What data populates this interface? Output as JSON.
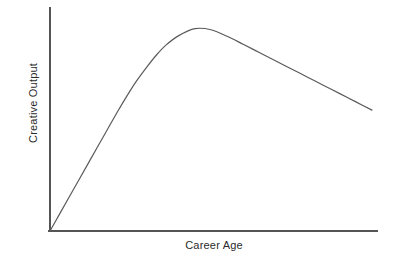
{
  "chart_data": {
    "type": "line",
    "title": "",
    "subtitle": "",
    "xlabel": "Career Age",
    "ylabel": "Creative Output",
    "grid": false,
    "legend": false,
    "legend_position": "none",
    "tick_labels_x": [],
    "tick_labels_y": [],
    "xlim": [
      0,
      100
    ],
    "ylim": [
      0,
      100
    ],
    "annotations": [],
    "series": [
      {
        "name": "Creative Output",
        "color": "#5a5a5a",
        "x": [
          0,
          3,
          6,
          9,
          12,
          15,
          18,
          21,
          24,
          27,
          30,
          33,
          36,
          40,
          45,
          50,
          55,
          60,
          65,
          70,
          75,
          80,
          85,
          90,
          95,
          100
        ],
        "values": [
          0,
          8.1,
          16.2,
          24.3,
          32.4,
          40.5,
          48.6,
          56.6,
          64.3,
          71.4,
          77.6,
          83.3,
          88.1,
          92.6,
          95.9,
          95.4,
          92.3,
          88.5,
          84.6,
          80.7,
          76.8,
          72.9,
          69.0,
          65.1,
          61.2,
          57.3
        ]
      }
    ],
    "peak": {
      "x": 46,
      "y": 96
    },
    "axes": {
      "color": "#555555",
      "y_axis_top_value": 100,
      "x_axis_right_value": 100
    },
    "colors": {
      "background": "#ffffff",
      "axis": "#555555",
      "curve": "#5a5a5a",
      "text": "#2b2b2b"
    }
  }
}
